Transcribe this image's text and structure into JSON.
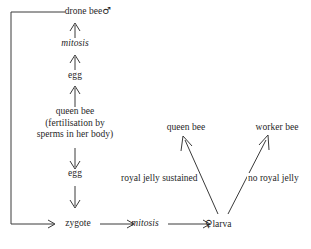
{
  "diagram": {
    "line_color": "#3a3a3a",
    "text_color": "#1f1f1f",
    "background": "#ffffff",
    "nodes": {
      "drone_bee": "drone bee",
      "drone_symbol": "♂",
      "mitosis_upper": "mitosis",
      "egg_upper": "egg",
      "queen_bee_parent_line1": "queen bee",
      "queen_bee_parent_line2": "(fertilisation by",
      "queen_bee_parent_line3": "sperms in her body)",
      "egg_lower": "egg",
      "zygote": "zygote",
      "mitosis_lower": "mitosis",
      "larva_symbol": "♀",
      "larva": "larva",
      "queen_bee_result": "queen bee",
      "worker_bee_result": "worker bee"
    },
    "edge_labels": {
      "royal_jelly_sustained": "royal jelly sustained",
      "no_royal_jelly": "no royal jelly"
    }
  }
}
